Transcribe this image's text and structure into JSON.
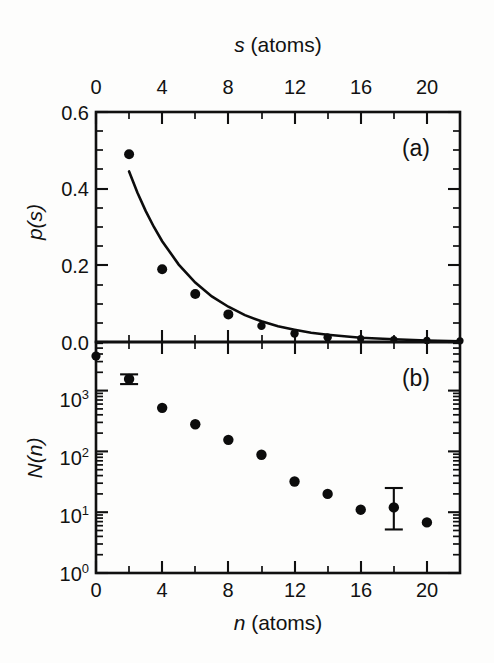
{
  "figure": {
    "panel_a_label": "(a)",
    "panel_b_label": "(b)",
    "top_axis_title_sym": "s",
    "top_axis_title_rest": " (atoms)",
    "bottom_axis_title_sym": "n",
    "bottom_axis_title_rest": " (atoms)",
    "ylabel_a_sym": "p",
    "ylabel_a_rest": "(s)",
    "ylabel_b_sym": "N",
    "ylabel_b_rest": "(n)",
    "x_ticklabels": [
      "0",
      "4",
      "8",
      "12",
      "16",
      "20"
    ],
    "y_ticklabels_a": [
      "0.6",
      "0.4",
      "0.2",
      "0.0"
    ],
    "y_ticklabels_b_mantissa": [
      "10",
      "10",
      "10",
      "10"
    ],
    "y_ticklabels_b_exponent": [
      "3",
      "2",
      "1",
      "0"
    ]
  },
  "chart_data": [
    {
      "type": "scatter",
      "panel": "(a)",
      "title": "",
      "xlabel": "s (atoms)",
      "ylabel": "p(s)",
      "xlabel_position": "top",
      "xlim": [
        0,
        22
      ],
      "ylim": [
        0.0,
        0.6
      ],
      "xticks": [
        0,
        4,
        8,
        12,
        16,
        20
      ],
      "xticks_minor_step": 2,
      "yticks": [
        0.0,
        0.2,
        0.4,
        0.6
      ],
      "yticks_minor_step": 0.05,
      "grid": false,
      "legend": null,
      "series": [
        {
          "name": "p(s) measured",
          "marker": "filled-circle",
          "x": [
            2,
            4,
            6,
            8,
            10,
            12,
            14,
            16,
            18,
            20,
            22
          ],
          "y": [
            0.49,
            0.19,
            0.125,
            0.072,
            0.042,
            0.022,
            0.012,
            0.009,
            0.006,
            0.004,
            0.003
          ]
        },
        {
          "name": "exponential fit",
          "marker": "line",
          "x": [
            2.0,
            2.5,
            3.0,
            3.5,
            4.0,
            5.0,
            6.0,
            7.0,
            8.0,
            9.0,
            10.0,
            11.0,
            12.0,
            13.0,
            14.0,
            16.0,
            18.0,
            20.0,
            22.0
          ],
          "y": [
            0.445,
            0.39,
            0.342,
            0.3,
            0.263,
            0.202,
            0.155,
            0.119,
            0.092,
            0.07,
            0.054,
            0.041,
            0.032,
            0.024,
            0.019,
            0.011,
            0.007,
            0.004,
            0.002
          ]
        }
      ]
    },
    {
      "type": "scatter",
      "panel": "(b)",
      "title": "",
      "xlabel": "n (atoms)",
      "ylabel": "N(n)",
      "xlabel_position": "bottom",
      "xlim": [
        0,
        22
      ],
      "ylim": [
        1,
        6300
      ],
      "yscale": "log",
      "xticks": [
        0,
        4,
        8,
        12,
        16,
        20
      ],
      "xticks_minor_step": 2,
      "yticks": [
        1,
        10,
        100,
        1000
      ],
      "grid": false,
      "legend": null,
      "series": [
        {
          "name": "N(n) counts",
          "marker": "filled-circle",
          "x": [
            0,
            2,
            4,
            6,
            8,
            10,
            12,
            14,
            16,
            18,
            20
          ],
          "y": [
            3700,
            1550,
            520,
            280,
            155,
            88,
            32,
            20,
            11,
            12,
            6.8
          ],
          "error_bars": [
            {
              "x": 2,
              "y": 1550,
              "ylow": 1280,
              "yhigh": 1850
            },
            {
              "x": 18,
              "y": 12,
              "ylow": 5.2,
              "yhigh": 25
            }
          ]
        }
      ]
    }
  ]
}
